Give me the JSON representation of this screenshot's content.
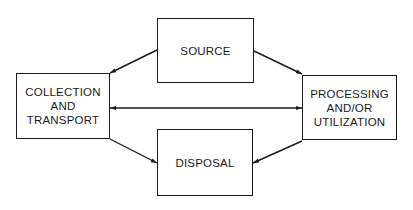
{
  "diagram": {
    "nodes": {
      "source": {
        "lines": [
          "SOURCE"
        ]
      },
      "collection": {
        "lines": [
          "COLLECTION",
          "AND",
          "TRANSPORT"
        ]
      },
      "processing": {
        "lines": [
          "PROCESSING",
          "AND/OR",
          "UTILIZATION"
        ]
      },
      "disposal": {
        "lines": [
          "DISPOSAL"
        ]
      }
    },
    "edges": [
      {
        "from": "SOURCE",
        "to": "COLLECTION AND TRANSPORT",
        "direction": "one-way"
      },
      {
        "from": "SOURCE",
        "to": "PROCESSING AND/OR UTILIZATION",
        "direction": "one-way"
      },
      {
        "from": "COLLECTION AND TRANSPORT",
        "to": "PROCESSING AND/OR UTILIZATION",
        "direction": "two-way"
      },
      {
        "from": "COLLECTION AND TRANSPORT",
        "to": "DISPOSAL",
        "direction": "one-way"
      },
      {
        "from": "PROCESSING AND/OR UTILIZATION",
        "to": "DISPOSAL",
        "direction": "one-way"
      }
    ],
    "colors": {
      "stroke": "#1a1a1a",
      "background": "#ffffff"
    }
  }
}
